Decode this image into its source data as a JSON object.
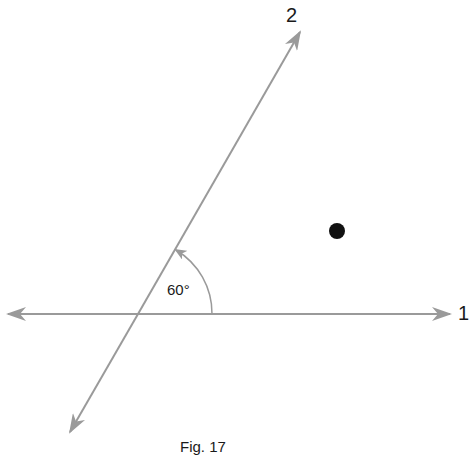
{
  "figure": {
    "caption": "Fig. 17",
    "lines": [
      {
        "id": "1",
        "label": "1",
        "orientation": "horizontal",
        "arrows": "both"
      },
      {
        "id": "2",
        "label": "2",
        "orientation": "oblique",
        "arrows": "both"
      }
    ],
    "angle": {
      "label": "60°",
      "between": [
        "1",
        "2"
      ]
    },
    "point": {
      "description": "black dot not on either line"
    },
    "colors": {
      "line": "#9a9a9a",
      "point": "#111111",
      "text": "#1a1a1a"
    }
  }
}
